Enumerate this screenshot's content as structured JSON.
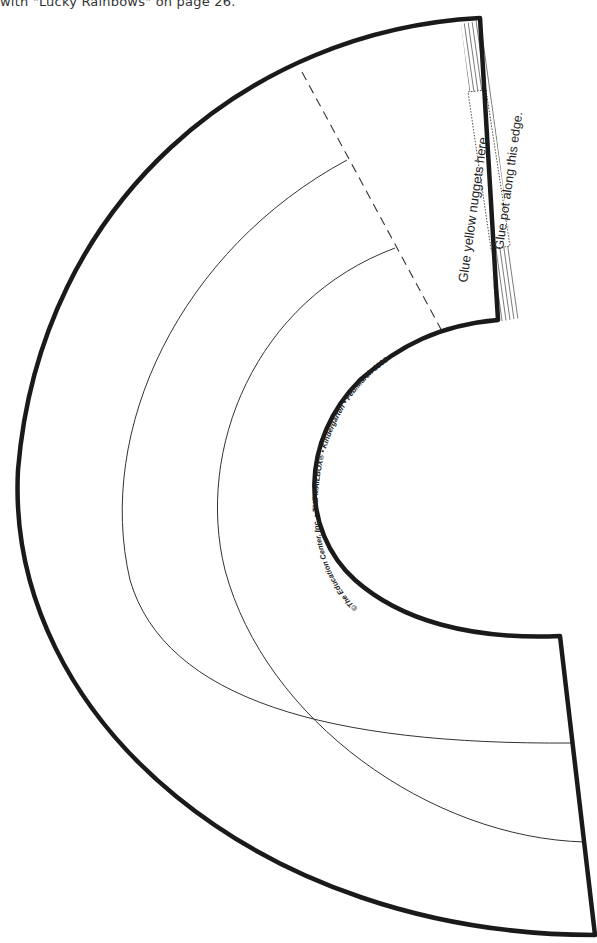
{
  "page": {
    "caption": "with \"Lucky Rainbows\" on page 26."
  },
  "template": {
    "shape": "rainbow-arc-pattern",
    "glue_nuggets_label": "Glue yellow nuggets here.",
    "glue_pot_label": "Glue pot along this edge.",
    "copyright_line": "©The Education Center, Inc. • THE MAILBOX® • Kindergarten • Feb/March 1999",
    "colors": {
      "outline": "#1a1a1a",
      "thin_line": "#333333",
      "background": "#ffffff"
    }
  }
}
